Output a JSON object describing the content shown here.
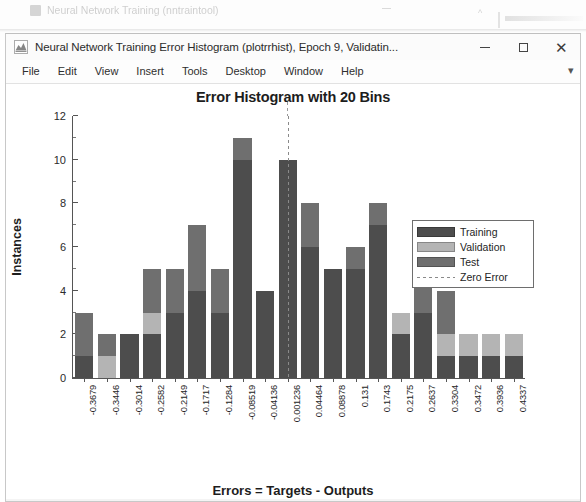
{
  "background_window": {
    "title": "Neural Network Training (nntraintool)",
    "icon": "app-icon"
  },
  "window": {
    "title": "Neural Network Training Error Histogram (plotrrhist), Epoch 9, Validatin...",
    "icon": "matlab-figure-icon",
    "controls": {
      "minimize": "–",
      "maximize": "□",
      "close": "✕"
    }
  },
  "menu": {
    "items": [
      {
        "label": "File"
      },
      {
        "label": "Edit"
      },
      {
        "label": "View"
      },
      {
        "label": "Insert"
      },
      {
        "label": "Tools"
      },
      {
        "label": "Desktop"
      },
      {
        "label": "Window"
      },
      {
        "label": "Help"
      }
    ],
    "overflow": "▾"
  },
  "colors": {
    "training": "#4d4d4d",
    "validation": "#b4b4b4",
    "test": "#6f6f6f",
    "zero_error": "#8a8a8a",
    "axis": "#555555",
    "background": "#ffffff"
  },
  "legend": {
    "entries": [
      {
        "label": "Training",
        "type": "swatch",
        "color": "#4d4d4d"
      },
      {
        "label": "Validation",
        "type": "swatch",
        "color": "#b4b4b4"
      },
      {
        "label": "Test",
        "type": "swatch",
        "color": "#6f6f6f"
      },
      {
        "label": "Zero Error",
        "type": "line",
        "color": "#8a8a8a"
      }
    ]
  },
  "chart_data": {
    "type": "bar",
    "subtype": "stacked-histogram",
    "title": "Error Histogram with 20 Bins",
    "xlabel": "Errors = Targets - Outputs",
    "ylabel": "Instances",
    "ylim": [
      0,
      12
    ],
    "yticks": [
      0,
      2,
      4,
      6,
      8,
      10,
      12
    ],
    "ytick_labels": [
      "0",
      "2",
      "4",
      "6",
      "8",
      "10",
      "12"
    ],
    "grid": false,
    "bins": 20,
    "legend_position": "top-right-inside",
    "categories": [
      "-0.3679",
      "-0.3446",
      "-0.3014",
      "-0.2582",
      "-0.2149",
      "-0.1717",
      "-0.1284",
      "-0.08519",
      "-0.04136",
      "0.001236",
      "0.04464",
      "0.08878",
      "0.131",
      "0.1743",
      "0.2175",
      "0.2637",
      "0.3304",
      "0.3472",
      "0.3936",
      "0.4337"
    ],
    "series": [
      {
        "name": "Training",
        "color": "#4d4d4d",
        "values": [
          1,
          0,
          2,
          2,
          3,
          4,
          3,
          10,
          4,
          10,
          6,
          5,
          5,
          7,
          2,
          3,
          1,
          1,
          1,
          1
        ]
      },
      {
        "name": "Validation",
        "color": "#b4b4b4",
        "values": [
          0,
          1,
          0,
          1,
          0,
          0,
          0,
          0,
          0,
          0,
          0,
          0,
          0,
          0,
          1,
          0,
          1,
          1,
          1,
          1
        ]
      },
      {
        "name": "Test",
        "color": "#6f6f6f",
        "values": [
          2,
          1,
          0,
          2,
          2,
          3,
          2,
          1,
          0,
          0,
          2,
          0,
          1,
          1,
          0,
          2,
          2,
          0,
          0,
          0
        ]
      }
    ],
    "totals": [
      3,
      2,
      2,
      5,
      5,
      7,
      5,
      11,
      4,
      10,
      8,
      5,
      6,
      8,
      3,
      5,
      4,
      2,
      2,
      2
    ],
    "zero_error_line": {
      "label": "Zero Error",
      "bin_index": 9
    }
  }
}
